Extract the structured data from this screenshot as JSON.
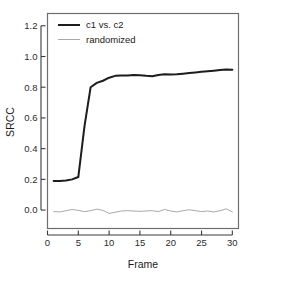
{
  "figure": {
    "background_color": "#ffffff",
    "frame_color": "#6e6e6e",
    "axis_color": "#3a3a3a"
  },
  "chart_data": {
    "type": "line",
    "title": "",
    "xlabel": "Frame",
    "ylabel": "SRCC",
    "xlim": [
      0,
      31
    ],
    "ylim": [
      -0.12,
      1.28
    ],
    "xticks": [
      0,
      5,
      10,
      15,
      20,
      25,
      30
    ],
    "xtick_labels": [
      "0",
      "5",
      "10",
      "15",
      "20",
      "25",
      "30"
    ],
    "yticks": [
      0.0,
      0.2,
      0.4,
      0.6,
      0.8,
      1.0,
      1.2
    ],
    "ytick_labels": [
      "0.0",
      "0.2",
      "0.4",
      "0.6",
      "0.8",
      "1.0",
      "1.2"
    ],
    "grid": false,
    "legend_position": "top-left",
    "x": [
      1,
      2,
      3,
      4,
      5,
      6,
      7,
      8,
      9,
      10,
      11,
      12,
      13,
      14,
      15,
      16,
      17,
      18,
      19,
      20,
      21,
      22,
      23,
      24,
      25,
      26,
      27,
      28,
      29,
      30
    ],
    "series": [
      {
        "name": "c1 vs. c2",
        "color": "#1c1c1c",
        "line_width": 2.0,
        "values": [
          0.19,
          0.19,
          0.192,
          0.2,
          0.215,
          0.545,
          0.8,
          0.828,
          0.842,
          0.862,
          0.874,
          0.876,
          0.876,
          0.88,
          0.878,
          0.874,
          0.872,
          0.88,
          0.884,
          0.882,
          0.884,
          0.888,
          0.892,
          0.896,
          0.9,
          0.904,
          0.908,
          0.912,
          0.916,
          0.914
        ]
      },
      {
        "name": "randomized",
        "color": "#9e9e9e",
        "line_width": 0.9,
        "values": [
          -0.01,
          -0.012,
          -0.004,
          0.004,
          -0.002,
          -0.01,
          -0.004,
          0.006,
          -0.002,
          -0.022,
          -0.014,
          -0.006,
          -0.004,
          -0.006,
          -0.008,
          -0.006,
          -0.004,
          -0.01,
          0.004,
          -0.006,
          -0.012,
          -0.004,
          0.002,
          -0.004,
          -0.01,
          -0.006,
          -0.012,
          -0.004,
          0.008,
          -0.012
        ]
      }
    ]
  },
  "legend": {
    "entries": [
      {
        "label": "c1 vs. c2",
        "color": "#1c1c1c",
        "line_width": 2.0
      },
      {
        "label": "randomized",
        "color": "#9e9e9e",
        "line_width": 0.9
      }
    ]
  },
  "caption": {
    "cut_off_text": ""
  }
}
